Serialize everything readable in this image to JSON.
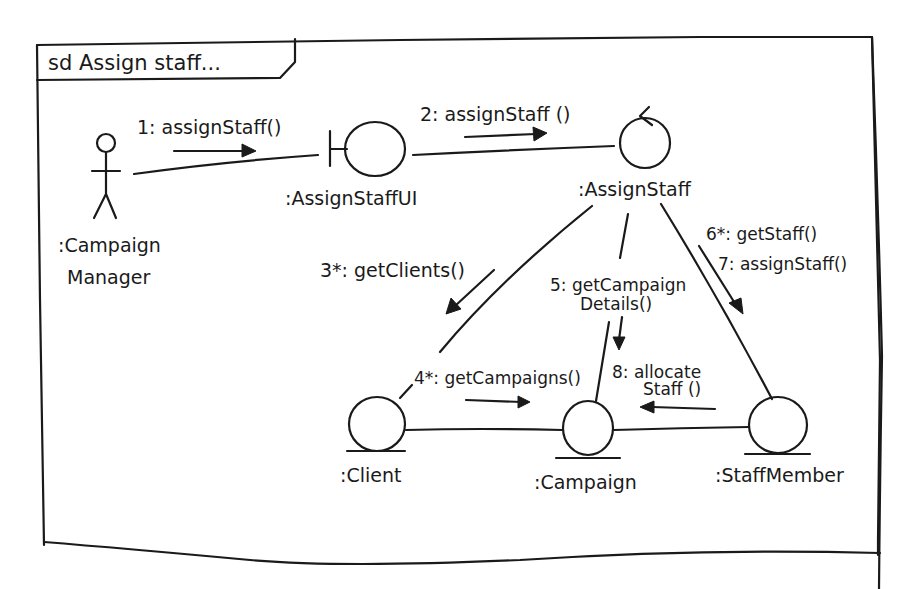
{
  "frame": {
    "title": "sd Assign staff..."
  },
  "objects": {
    "actor": {
      "label_line1": ":Campaign",
      "label_line2": "Manager",
      "type": "actor"
    },
    "boundary": {
      "label": ":AssignStaffUI",
      "type": "boundary"
    },
    "control": {
      "label": ":AssignStaff",
      "type": "control"
    },
    "client": {
      "label": ":Client",
      "type": "entity"
    },
    "campaign": {
      "label": ":Campaign",
      "type": "entity"
    },
    "staff_member": {
      "label": ":StaffMember",
      "type": "entity"
    }
  },
  "messages": [
    {
      "id": "m1",
      "text": "1: assignStaff()",
      "from": "actor",
      "to": "boundary"
    },
    {
      "id": "m2",
      "text": "2: assignStaff ()",
      "from": "boundary",
      "to": "control"
    },
    {
      "id": "m3",
      "text": "3*: getClients()",
      "from": "control",
      "to": "client"
    },
    {
      "id": "m4",
      "text": "4*: getCampaigns()",
      "from": "client",
      "to": "campaign"
    },
    {
      "id": "m5_line1",
      "text": "5: getCampaign",
      "from": "control",
      "to": "campaign"
    },
    {
      "id": "m5_line2",
      "text": "Details()"
    },
    {
      "id": "m6",
      "text": "6*: getStaff()",
      "from": "control",
      "to": "staff_member"
    },
    {
      "id": "m7",
      "text": "7: assignStaff()",
      "from": "control",
      "to": "staff_member"
    },
    {
      "id": "m8_line1",
      "text": "8: allocate",
      "from": "staff_member",
      "to": "campaign"
    },
    {
      "id": "m8_line2",
      "text": "Staff ()"
    }
  ]
}
